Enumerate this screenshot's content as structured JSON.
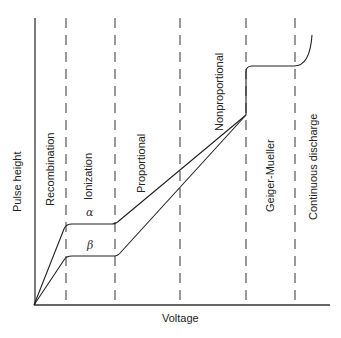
{
  "diagram": {
    "type": "gas-detector-response-curve",
    "axes": {
      "x_label": "Voltage",
      "y_label": "Pulse height"
    },
    "regions": [
      {
        "label": "Recombination"
      },
      {
        "label": "Ionization"
      },
      {
        "label": "Proportional"
      },
      {
        "label": "Nonproportional"
      },
      {
        "label": "Geiger-Mueller"
      },
      {
        "label": "Continuous discharge"
      }
    ],
    "curves": [
      {
        "label": "α",
        "name": "alpha"
      },
      {
        "label": "β",
        "name": "beta"
      }
    ],
    "colors": {
      "line": "#222222",
      "dashed": "#555555",
      "background": "#ffffff"
    }
  }
}
